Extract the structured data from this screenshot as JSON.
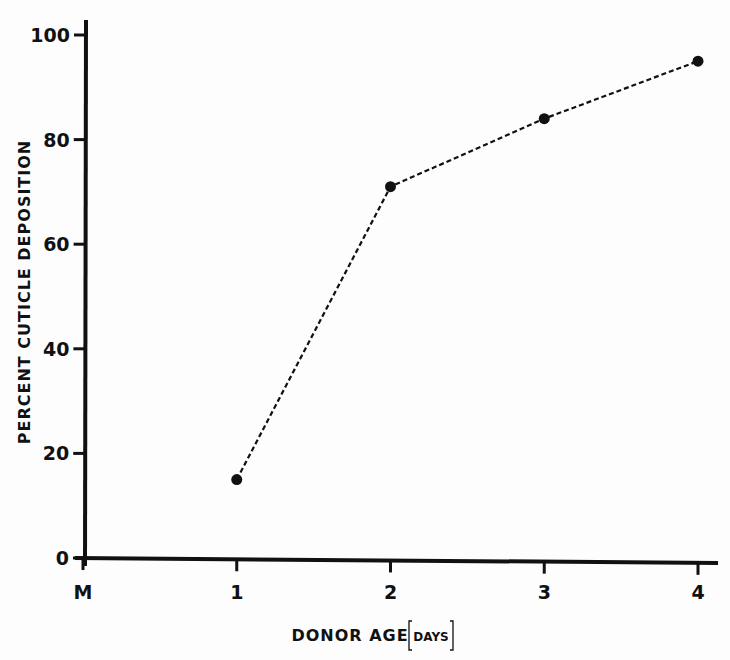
{
  "chart_data": {
    "type": "line",
    "title": "",
    "xlabel": "DONOR AGE",
    "xlabel_unit": "DAYS",
    "ylabel": "PERCENT CUTICLE DEPOSITION",
    "categories": [
      "M",
      "1",
      "2",
      "3",
      "4"
    ],
    "x_ticks": [
      "M",
      "1",
      "2",
      "3",
      "4"
    ],
    "y_ticks": [
      0,
      20,
      40,
      60,
      80,
      100
    ],
    "ylim": [
      0,
      100
    ],
    "grid": false,
    "legend": null,
    "series": [
      {
        "name": "Cuticle deposition",
        "line_style": "dashed",
        "marker": "filled-circle",
        "x": [
          1,
          2,
          3,
          4
        ],
        "values": [
          15,
          71,
          84,
          95
        ]
      }
    ]
  },
  "colors": {
    "background": "#fdfdfd",
    "ink": "#111111"
  }
}
